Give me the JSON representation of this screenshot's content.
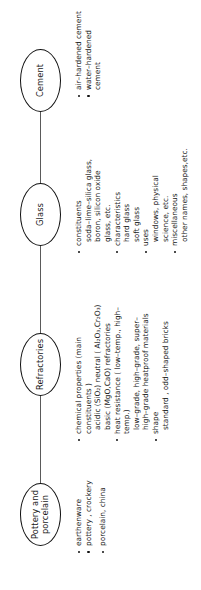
{
  "diagram": {
    "type": "tree",
    "orientation": "rotated-90-ccw",
    "line_color": "#5a5a5a",
    "node_border_color": "#111111",
    "nodes": [
      {
        "id": "pottery",
        "label": "Pottery and\nporcelain"
      },
      {
        "id": "refractories",
        "label": "Refractories"
      },
      {
        "id": "glass",
        "label": "Glass"
      },
      {
        "id": "cement",
        "label": "Cement"
      }
    ],
    "groups": {
      "pottery": {
        "bullets": [
          {
            "text": "earthenware",
            "sub": []
          },
          {
            "text": "pottery , crockery",
            "sub": []
          },
          {
            "text": "porcelain, china",
            "sub": []
          }
        ]
      },
      "refractories": {
        "bullets": [
          {
            "text": "chemical properties (main\nconstituents )",
            "sub": [
              "acidic (SiO₂) neutral ( Al₂O₃,Cr₂O₃)",
              "basic (MgO,CaO) refractories"
            ]
          },
          {
            "text": "heat resistance ( low–temp., high–\ntemp.)",
            "sub": [
              "low–grade, high–grade, super–",
              "high–grade heatproof materials"
            ]
          },
          {
            "text": "shape",
            "sub": [
              "standard , odd–shaped bricks"
            ]
          }
        ]
      },
      "glass": {
        "bullets": [
          {
            "text": "constituents",
            "sub": [
              "soda–lime–silica glass,",
              "boron, silicon oxide",
              "glass, etc."
            ]
          },
          {
            "text": "characteristics",
            "sub": [
              "hard glass",
              "soft glass"
            ]
          },
          {
            "text": "uses",
            "sub": [
              "windows, physical",
              "science, etc."
            ]
          },
          {
            "text": "miscellaneous",
            "sub": [
              "other names, shapes,etc."
            ]
          }
        ]
      },
      "cement": {
        "bullets": [
          {
            "text": "air–hardened cement",
            "sub": []
          },
          {
            "text": "water–hardened cement",
            "sub": []
          }
        ]
      }
    }
  }
}
